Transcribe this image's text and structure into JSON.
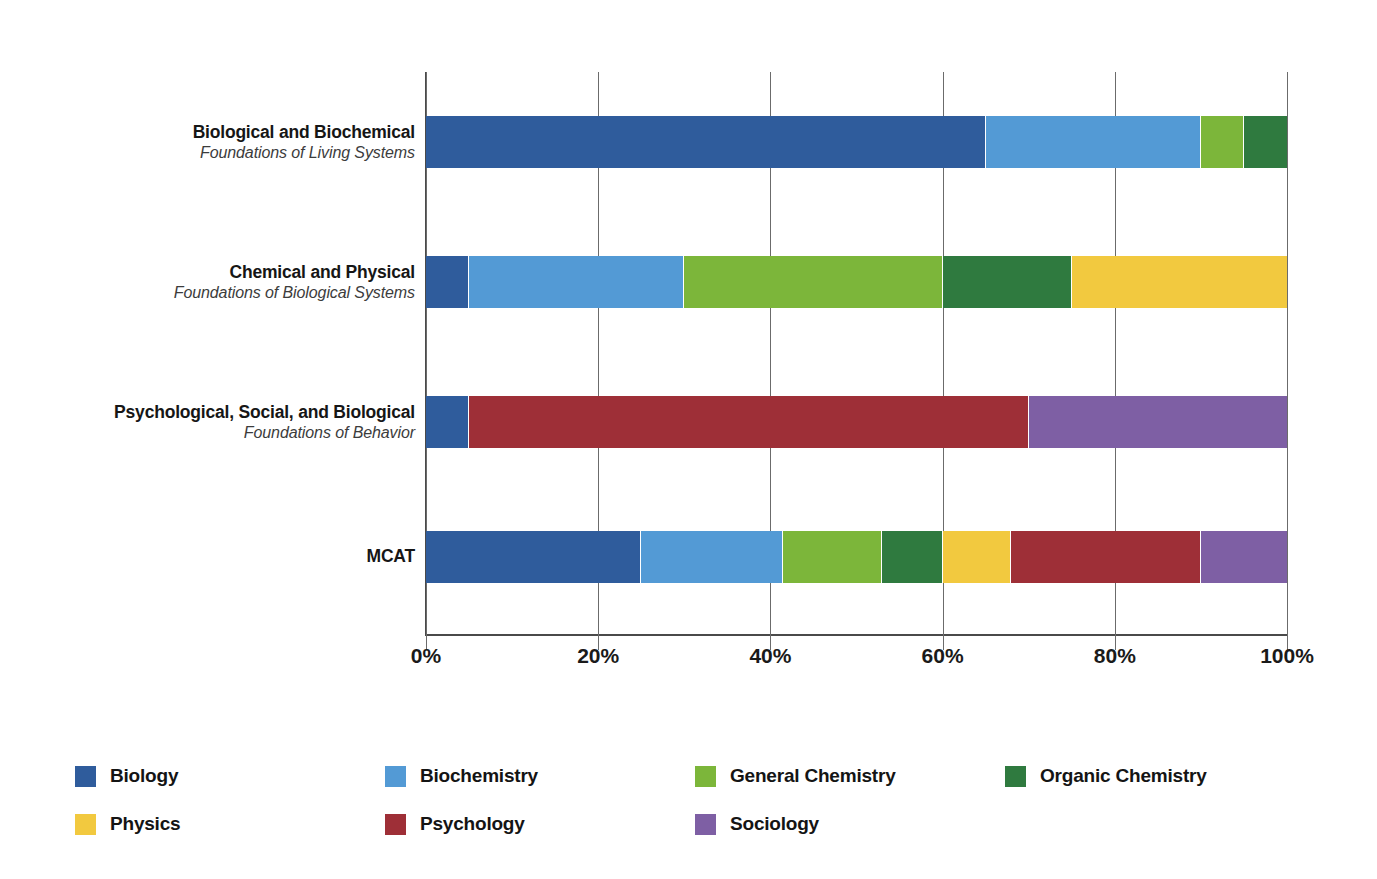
{
  "chart_data": {
    "type": "bar",
    "orientation": "horizontal",
    "stacked": true,
    "normalized_percent": true,
    "title": "",
    "xlabel": "",
    "ylabel": "",
    "xlim": [
      0,
      100
    ],
    "grid": true,
    "legend_position": "bottom",
    "categories": [
      "Biological and Biochemical Foundations of Living Systems",
      "Chemical and Physical Foundations of Biological Systems",
      "Psychological, Social, and Biological Foundations of Behavior",
      "MCAT"
    ],
    "tick_labels": [
      "0%",
      "20%",
      "40%",
      "60%",
      "80%",
      "100%"
    ],
    "tick_values": [
      0,
      20,
      40,
      60,
      80,
      100
    ],
    "series": [
      {
        "name": "Biology",
        "color": "#2f5c9c",
        "values": [
          65,
          5,
          5,
          25
        ]
      },
      {
        "name": "Biochemistry",
        "color": "#539ad5",
        "values": [
          25,
          25,
          0,
          16.5
        ]
      },
      {
        "name": "General Chemistry",
        "color": "#7cb63a",
        "values": [
          5,
          30,
          0,
          11.5
        ]
      },
      {
        "name": "Organic Chemistry",
        "color": "#2f7a3f",
        "values": [
          5,
          15,
          0,
          7
        ]
      },
      {
        "name": "Physics",
        "color": "#f2c93f",
        "values": [
          0,
          25,
          0,
          8
        ]
      },
      {
        "name": "Psychology",
        "color": "#9e2f37",
        "values": [
          0,
          0,
          65,
          22
        ]
      },
      {
        "name": "Sociology",
        "color": "#7e5fa4",
        "values": [
          0,
          0,
          30,
          10
        ]
      }
    ]
  },
  "rows": [
    {
      "line1": "Biological and Biochemical",
      "line2": "Foundations of Living Systems"
    },
    {
      "line1": "Chemical and Physical",
      "line2": "Foundations of Biological Systems"
    },
    {
      "line1": "Psychological, Social, and Biological",
      "line2": "Foundations of Behavior"
    },
    {
      "line1": "MCAT",
      "line2": ""
    }
  ],
  "legend": {
    "items": [
      {
        "label": "Biology",
        "color": "#2f5c9c"
      },
      {
        "label": "Biochemistry",
        "color": "#539ad5"
      },
      {
        "label": "General Chemistry",
        "color": "#7cb63a"
      },
      {
        "label": "Organic Chemistry",
        "color": "#2f7a3f"
      },
      {
        "label": "Physics",
        "color": "#f2c93f"
      },
      {
        "label": "Psychology",
        "color": "#9e2f37"
      },
      {
        "label": "Sociology",
        "color": "#7e5fa4"
      }
    ]
  },
  "axis": {
    "ticks": [
      "0%",
      "20%",
      "40%",
      "60%",
      "80%",
      "100%"
    ]
  }
}
